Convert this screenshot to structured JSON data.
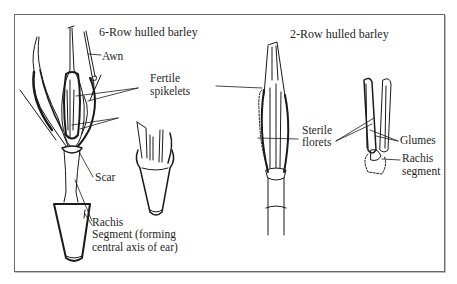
{
  "diagram": {
    "panels": [
      {
        "title": "6-Row hulled barley",
        "labels": {
          "awn": "Awn",
          "fertile_spikelets_1": "Fertile",
          "fertile_spikelets_2": "spikelets",
          "scar": "Scar",
          "rachis_1": "Rachis",
          "rachis_2": "Segment (forming",
          "rachis_3": "central axis of ear)"
        }
      },
      {
        "title": "2-Row hulled barley",
        "labels": {
          "sterile_florets_1": "Sterile",
          "sterile_florets_2": "florets",
          "glumes": "Glumes",
          "rachis_segment_1": "Rachis",
          "rachis_segment_2": "segment"
        }
      }
    ],
    "colors": {
      "ink": "#1a1a1a",
      "frame": "#6a6a6a",
      "background": "#ffffff"
    }
  }
}
